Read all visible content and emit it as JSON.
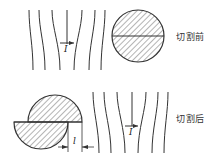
{
  "panels": [
    {
      "id": "before",
      "label": "切割前",
      "current_symbol": "I"
    },
    {
      "id": "after",
      "label": "切割后",
      "current_symbol": "I",
      "dimension_symbol": "l"
    }
  ],
  "colors": {
    "line": "#333333",
    "hatch": "#444444",
    "background": "#ffffff"
  }
}
